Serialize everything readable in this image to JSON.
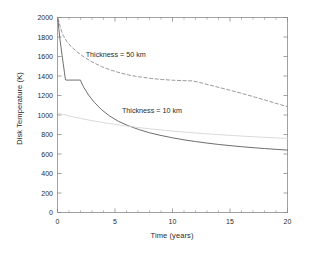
{
  "figure": {
    "background": "#ffffff",
    "axis_color": "#8a8a8a",
    "text_color": "#2b2b2b"
  },
  "chart_data": {
    "type": "line",
    "title": "",
    "xlabel": "Time (years)",
    "ylabel": "Disk Temperature (K)",
    "xlim": [
      0,
      20
    ],
    "ylim": [
      0,
      2000
    ],
    "xticks": [
      0,
      5,
      10,
      15,
      20
    ],
    "xticklabels": [
      "0",
      "5",
      "10",
      "15",
      "20"
    ],
    "yticks": [
      0,
      200,
      400,
      600,
      800,
      1000,
      1200,
      1400,
      1600,
      1800,
      2000
    ],
    "yticklabels": [
      "0",
      "200",
      "400",
      "600",
      "800",
      "1000",
      "1200",
      "1400",
      "1600",
      "1800",
      "2000"
    ],
    "grid": false,
    "legend": "annotations",
    "annotations": [
      {
        "text": "Thickness = 50 km",
        "x": 2.45,
        "y": 1600,
        "color": "#2b2b2b"
      },
      {
        "text": "Thickness = 10 km",
        "x": 5.6,
        "y": 1020,
        "color": "#2b2b2b"
      }
    ],
    "series": [
      {
        "name": "Thickness = 50 km",
        "style": "dashed",
        "color": "#9a9a9a",
        "x": [
          0.05,
          0.2,
          0.35,
          0.5,
          0.8,
          1.2,
          1.7,
          2.3,
          3.0,
          3.8,
          4.6,
          5.5,
          6.4,
          7.3,
          8.2,
          9.1,
          10.0,
          10.8,
          11.4,
          11.7,
          12.3,
          13.2,
          14.2,
          15.2,
          16.2,
          17.2,
          18.2,
          19.1,
          20.0
        ],
        "y": [
          1990,
          1920,
          1860,
          1815,
          1755,
          1700,
          1648,
          1595,
          1545,
          1498,
          1462,
          1430,
          1405,
          1388,
          1374,
          1364,
          1357,
          1353,
          1351,
          1350,
          1336,
          1308,
          1278,
          1248,
          1216,
          1182,
          1148,
          1116,
          1085
        ]
      },
      {
        "name": "Thickness = 10 km",
        "style": "solid",
        "color": "#6e6e6e",
        "x": [
          0.05,
          0.12,
          0.2,
          0.3,
          0.4,
          0.5,
          0.6,
          0.68,
          0.72,
          1.0,
          1.4,
          1.8,
          2.0,
          2.05,
          2.3,
          2.7,
          3.2,
          3.8,
          4.5,
          5.3,
          6.2,
          7.1,
          8.0,
          9.0,
          10.0,
          11.0,
          12.0,
          13.0,
          14.0,
          15.0,
          16.0,
          17.0,
          18.0,
          19.0,
          20.0
        ],
        "y": [
          1975,
          1880,
          1790,
          1700,
          1610,
          1525,
          1440,
          1370,
          1358,
          1358,
          1358,
          1358,
          1358,
          1340,
          1280,
          1205,
          1130,
          1058,
          992,
          935,
          888,
          850,
          818,
          790,
          766,
          745,
          728,
          712,
          698,
          686,
          675,
          665,
          656,
          648,
          640
        ]
      },
      {
        "name": "lower-faint-curve",
        "style": "solid-faint",
        "color": "#d0d0d0",
        "x": [
          0.05,
          0.5,
          1.2,
          2.0,
          3.0,
          4.2,
          5.5,
          7.0,
          8.5,
          10.0,
          11.5,
          13.0,
          14.5,
          16.0,
          17.5,
          19.0,
          20.0
        ],
        "y": [
          1020,
          1005,
          985,
          965,
          942,
          918,
          895,
          872,
          852,
          835,
          820,
          807,
          795,
          784,
          774,
          765,
          760
        ]
      }
    ]
  }
}
